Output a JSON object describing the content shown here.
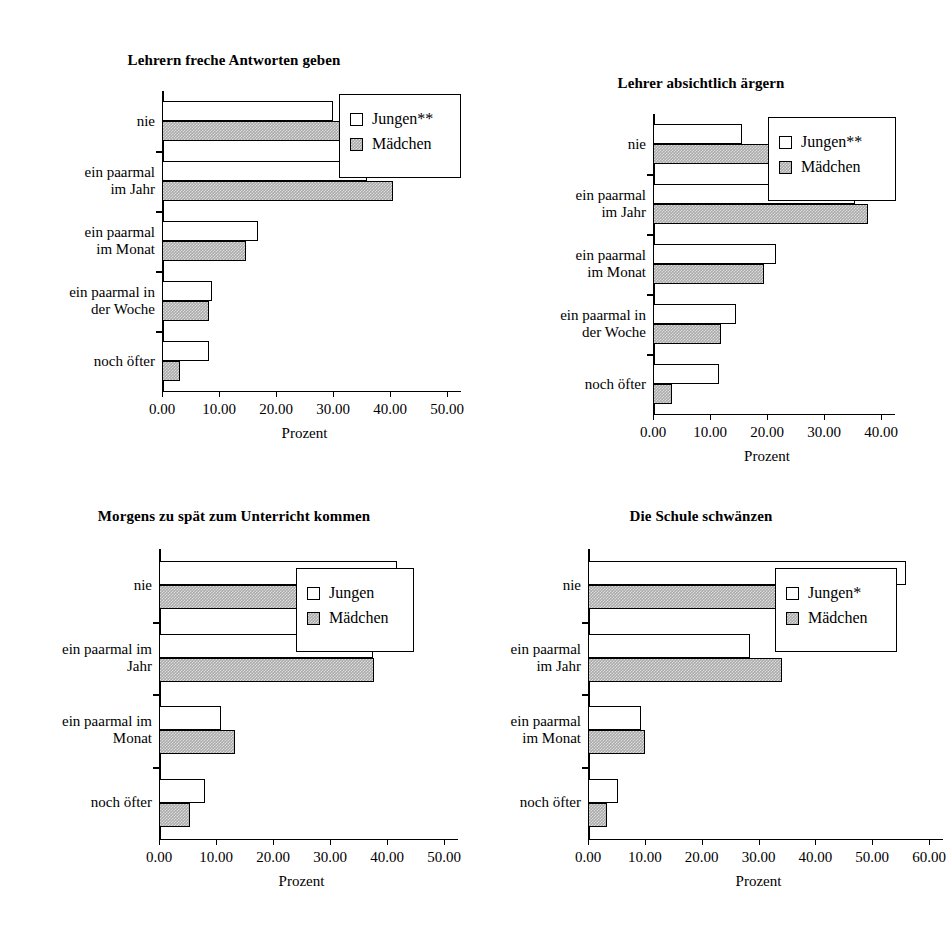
{
  "figure": {
    "series_names": [
      "Jungen",
      "Mädchen"
    ],
    "x_axis_title": "Prozent"
  },
  "charts": [
    {
      "id": "chart-1",
      "title": "Lehrern freche Antworten geben",
      "legend": {
        "jungen": "Jungen**",
        "maedchen": "Mädchen"
      },
      "chart_data": {
        "type": "bar",
        "orientation": "horizontal",
        "title": "Lehrern freche Antworten geben",
        "xlabel": "Prozent",
        "ylabel": "",
        "xlim": [
          0,
          50
        ],
        "xticks": [
          "0.00",
          "10.00",
          "20.00",
          "30.00",
          "40.00",
          "50.00"
        ],
        "grid": false,
        "legend_position": "upper right",
        "categories": [
          "noch öfter",
          "ein paarmal in\nder Woche",
          "ein paarmal\nim Monat",
          "ein paarmal\nim Jahr",
          "nie"
        ],
        "series": [
          {
            "name": "Jungen**",
            "values": [
              8.3,
              8.8,
              16.8,
              36.0,
              30.0
            ]
          },
          {
            "name": "Mädchen",
            "values": [
              3.2,
              8.3,
              14.8,
              40.5,
              32.8
            ]
          }
        ]
      }
    },
    {
      "id": "chart-2",
      "title": "Lehrer absichtlich ärgern",
      "legend": {
        "jungen": "Jungen**",
        "maedchen": "Mädchen"
      },
      "chart_data": {
        "type": "bar",
        "orientation": "horizontal",
        "title": "Lehrer absichtlich ärgern",
        "xlabel": "Prozent",
        "ylabel": "",
        "xlim": [
          0,
          40
        ],
        "xticks": [
          "0.00",
          "10.00",
          "20.00",
          "30.00",
          "40.00"
        ],
        "grid": false,
        "legend_position": "upper right",
        "categories": [
          "noch öfter",
          "ein paarmal in\nder Woche",
          "ein paarmal\nim Monat",
          "ein paarmal\nim Jahr",
          "nie"
        ],
        "series": [
          {
            "name": "Jungen**",
            "values": [
              11.5,
              14.5,
              21.5,
              35.5,
              15.6
            ]
          },
          {
            "name": "Mädchen",
            "values": [
              3.4,
              12.0,
              19.5,
              37.8,
              26.8
            ]
          }
        ]
      }
    },
    {
      "id": "chart-3",
      "title": "Morgens zu spät zum Unterricht kommen",
      "legend": {
        "jungen": "Jungen",
        "maedchen": "Mädchen"
      },
      "chart_data": {
        "type": "bar",
        "orientation": "horizontal",
        "title": "Morgens zu spät zum Unterricht kommen",
        "xlabel": "Prozent",
        "ylabel": "",
        "xlim": [
          0,
          50
        ],
        "xticks": [
          "0.00",
          "10.00",
          "20.00",
          "30.00",
          "40.00",
          "50.00"
        ],
        "grid": false,
        "legend_position": "upper right",
        "categories": [
          "noch öfter",
          "ein paarmal im\nMonat",
          "ein paarmal im\nJahr",
          "nie"
        ],
        "series": [
          {
            "name": "Jungen",
            "values": [
              8.0,
              10.8,
              37.5,
              41.8
            ]
          },
          {
            "name": "Mädchen",
            "values": [
              5.5,
              13.3,
              37.8,
              41.8
            ]
          }
        ]
      }
    },
    {
      "id": "chart-4",
      "title": "Die Schule schwänzen",
      "legend": {
        "jungen": "Jungen*",
        "maedchen": "Mädchen"
      },
      "chart_data": {
        "type": "bar",
        "orientation": "horizontal",
        "title": "Die Schule schwänzen",
        "xlabel": "Prozent",
        "ylabel": "",
        "xlim": [
          0,
          60
        ],
        "xticks": [
          "0.00",
          "10.00",
          "20.00",
          "30.00",
          "40.00",
          "50.00",
          "60.00"
        ],
        "grid": false,
        "legend_position": "upper right",
        "categories": [
          "noch öfter",
          "ein paarmal\nim Monat",
          "ein paarmal\nim Jahr",
          "nie"
        ],
        "series": [
          {
            "name": "Jungen*",
            "values": [
              5.3,
              9.4,
              28.5,
              56.0
            ]
          },
          {
            "name": "Mädchen",
            "values": [
              3.3,
              10.0,
              34.2,
              52.0
            ]
          }
        ]
      }
    }
  ]
}
